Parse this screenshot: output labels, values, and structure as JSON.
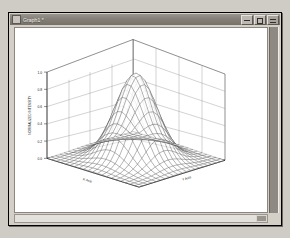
{
  "window": {
    "title": "Graph1 *",
    "sysmenu_icon": "system-menu-icon",
    "minimize_label": "_",
    "maximize_label": "□",
    "close_label": "×"
  },
  "workspace": {
    "child_window_button_label": ""
  },
  "scrollbars": {
    "vertical_name": "vertical-scrollbar",
    "horizontal_name": "horizontal-scrollbar"
  },
  "chart_data": {
    "type": "line",
    "subtype": "surface-mesh-3d",
    "title": "",
    "xlabel": "X Axis",
    "ylabel": "Y Axis",
    "zlabel": "NORMALIZED INTENSITY",
    "ztick_labels": [
      "0.0",
      "0.2",
      "0.4",
      "0.6",
      "0.8",
      "1.0"
    ],
    "ztick_values": [
      0.0,
      0.2,
      0.4,
      0.6,
      0.8,
      1.0
    ],
    "zlim": [
      0.0,
      1.0
    ],
    "xlim": [
      -3,
      3
    ],
    "ylim": [
      -3,
      3
    ],
    "xtick_labels": [
      "-3",
      "-2",
      "-1",
      "0",
      "1",
      "2",
      "3"
    ],
    "ytick_labels": [
      "-3",
      "-2",
      "-1",
      "0",
      "1",
      "2",
      "3"
    ],
    "grid": true,
    "legend": "none",
    "mesh_rows": 21,
    "mesh_cols": 21,
    "surface_function": "gaussian peak z = exp(-(x^2+y^2)/2)",
    "peak_value": 1.0,
    "peak_x": 0,
    "peak_y": 0,
    "annotations": []
  }
}
